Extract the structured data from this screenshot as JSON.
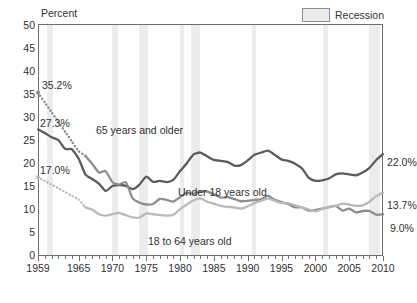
{
  "legend": {
    "swatch_name": "recession-swatch",
    "label": "Recession",
    "color": "#ececec"
  },
  "axis": {
    "y_title": "Percent",
    "y_ticks": [
      "50",
      "45",
      "40",
      "35",
      "30",
      "25",
      "20",
      "15",
      "10",
      "5",
      "0"
    ],
    "x_ticks": [
      "1959",
      "1965",
      "1970",
      "1975",
      "1980",
      "1985",
      "1990",
      "1995",
      "2000",
      "2005",
      "2010"
    ]
  },
  "callouts": {
    "start": [
      {
        "name": "start-65-older",
        "text": "35.2%"
      },
      {
        "name": "start-under-18",
        "text": "27.3%"
      },
      {
        "name": "start-18-64",
        "text": "17.0%"
      }
    ],
    "end": [
      {
        "name": "end-under-18",
        "text": "22.0%"
      },
      {
        "name": "end-65-older",
        "text": "13.7%"
      },
      {
        "name": "end-18-64",
        "text": "9.0%"
      }
    ]
  },
  "series_labels": [
    {
      "name": "label-65-and-older",
      "text": "65 years and older"
    },
    {
      "name": "label-under-18",
      "text": "Under 18 years old"
    },
    {
      "name": "label-18-to-64",
      "text": "18 to 64 years old"
    }
  ],
  "chart_data": {
    "type": "line",
    "title": "",
    "xlabel": "",
    "ylabel": "Percent",
    "xlim": [
      1959,
      2010
    ],
    "ylim": [
      0,
      50
    ],
    "ygrid": false,
    "legend_position": "top-right",
    "colors": {
      "under_18": "#5b5b5b",
      "65_and_older": "#8d8d8d",
      "18_to_64": "#b9b9b9",
      "recession_band": "#ececec"
    },
    "annotations": [
      {
        "text": "35.2%",
        "series": "65 years and older",
        "x": 1959,
        "y": 35.2
      },
      {
        "text": "27.3%",
        "series": "Under 18 years old",
        "x": 1959,
        "y": 27.3
      },
      {
        "text": "17.0%",
        "series": "18 to 64 years old",
        "x": 1959,
        "y": 17.0
      },
      {
        "text": "22.0%",
        "series": "Under 18 years old",
        "x": 2010,
        "y": 22.0
      },
      {
        "text": "13.7%",
        "series": "65 years and older",
        "x": 2010,
        "y": 13.7
      },
      {
        "text": "9.0%",
        "series": "18 to 64 years old",
        "x": 2010,
        "y": 9.0
      }
    ],
    "recessions": [
      {
        "start": 1960.3,
        "end": 1961.2
      },
      {
        "start": 1969.9,
        "end": 1970.9
      },
      {
        "start": 1973.9,
        "end": 1975.2
      },
      {
        "start": 1980.0,
        "end": 1980.6
      },
      {
        "start": 1981.6,
        "end": 1982.9
      },
      {
        "start": 1990.6,
        "end": 1991.2
      },
      {
        "start": 2001.2,
        "end": 2001.9
      },
      {
        "start": 2007.9,
        "end": 2009.5
      }
    ],
    "x": [
      1959,
      1960,
      1961,
      1962,
      1963,
      1964,
      1965,
      1966,
      1967,
      1968,
      1969,
      1970,
      1971,
      1972,
      1973,
      1974,
      1975,
      1976,
      1977,
      1978,
      1979,
      1980,
      1981,
      1982,
      1983,
      1984,
      1985,
      1986,
      1987,
      1988,
      1989,
      1990,
      1991,
      1992,
      1993,
      1994,
      1995,
      1996,
      1997,
      1998,
      1999,
      2000,
      2001,
      2002,
      2003,
      2004,
      2005,
      2006,
      2007,
      2008,
      2009,
      2010
    ],
    "series": [
      {
        "name": "Under 18 years old",
        "dashed_segment": false,
        "values": [
          27.3,
          26.5,
          25.6,
          25.0,
          23.1,
          23.0,
          21.0,
          17.6,
          16.6,
          15.6,
          14.0,
          15.1,
          15.3,
          15.1,
          14.4,
          15.4,
          17.1,
          16.0,
          16.2,
          15.9,
          16.4,
          18.3,
          20.0,
          21.9,
          22.3,
          21.5,
          20.7,
          20.5,
          20.3,
          19.5,
          19.6,
          20.6,
          21.8,
          22.3,
          22.7,
          21.8,
          20.8,
          20.5,
          19.9,
          18.9,
          16.9,
          16.2,
          16.3,
          16.7,
          17.6,
          17.8,
          17.6,
          17.4,
          18.0,
          19.0,
          20.7,
          22.0
        ]
      },
      {
        "name": "65 years and older",
        "dashed_segment": true,
        "dashed_from": 1959,
        "dashed_to": 1966,
        "values": [
          35.2,
          33.1,
          31.0,
          28.9,
          26.8,
          24.7,
          22.6,
          21.6,
          19.9,
          18.0,
          18.3,
          15.9,
          15.4,
          15.9,
          12.4,
          11.5,
          11.1,
          11.2,
          12.3,
          12.1,
          11.7,
          12.7,
          13.6,
          13.4,
          13.9,
          13.9,
          13.3,
          12.6,
          12.7,
          12.3,
          11.8,
          11.9,
          12.1,
          12.2,
          13.0,
          12.1,
          11.6,
          11.2,
          10.5,
          10.5,
          9.8,
          9.9,
          10.2,
          10.5,
          10.8,
          9.8,
          10.2,
          9.4,
          9.7,
          9.7,
          8.9,
          9.0
        ]
      },
      {
        "name": "18 to 64 years old",
        "dashed_segment": true,
        "dashed_from": 1959,
        "dashed_to": 1966,
        "values": [
          17.0,
          16.2,
          15.4,
          14.6,
          13.8,
          13.0,
          12.2,
          10.5,
          10.0,
          9.0,
          8.7,
          9.0,
          9.3,
          8.8,
          8.3,
          8.3,
          9.2,
          9.0,
          8.8,
          8.7,
          8.9,
          10.1,
          11.1,
          12.0,
          12.4,
          11.7,
          11.3,
          10.8,
          10.6,
          10.5,
          10.2,
          10.7,
          11.4,
          11.9,
          12.4,
          11.9,
          11.4,
          11.4,
          10.9,
          10.5,
          10.0,
          9.6,
          10.1,
          10.6,
          10.8,
          11.3,
          11.1,
          10.8,
          10.9,
          11.7,
          12.9,
          13.7
        ]
      }
    ]
  }
}
